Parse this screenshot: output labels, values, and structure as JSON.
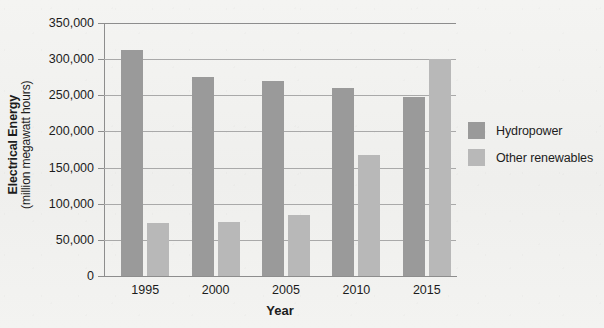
{
  "chart_data": {
    "type": "bar",
    "title": "",
    "xlabel": "Year",
    "ylabel": "Electrical Energy",
    "ylabel_sub": "(million megawatt hours)",
    "categories": [
      "1995",
      "2000",
      "2005",
      "2010",
      "2015"
    ],
    "series": [
      {
        "name": "Hydropower",
        "color": "#9a9a9a",
        "values": [
          312000,
          276000,
          270000,
          260000,
          248000
        ]
      },
      {
        "name": "Other renewables",
        "color": "#b8b8b8",
        "values": [
          73000,
          75000,
          85000,
          167000,
          300000
        ]
      }
    ],
    "ylim": [
      0,
      350000
    ],
    "ytick_step": 50000,
    "yticks": [
      "0",
      "50,000",
      "100,000",
      "150,000",
      "200,000",
      "250,000",
      "300,000",
      "350,000"
    ],
    "ytick_values": [
      0,
      50000,
      100000,
      150000,
      200000,
      250000,
      300000,
      350000
    ],
    "grid": true,
    "legend_position": "right"
  },
  "legend": {
    "items": [
      {
        "label": "Hydropower",
        "color": "#9a9a9a"
      },
      {
        "label": "Other renewables",
        "color": "#b8b8b8"
      }
    ]
  },
  "axes": {
    "y_title_main": "Electrical Energy",
    "y_title_sub": "(million megawatt hours)",
    "x_title": "Year"
  }
}
